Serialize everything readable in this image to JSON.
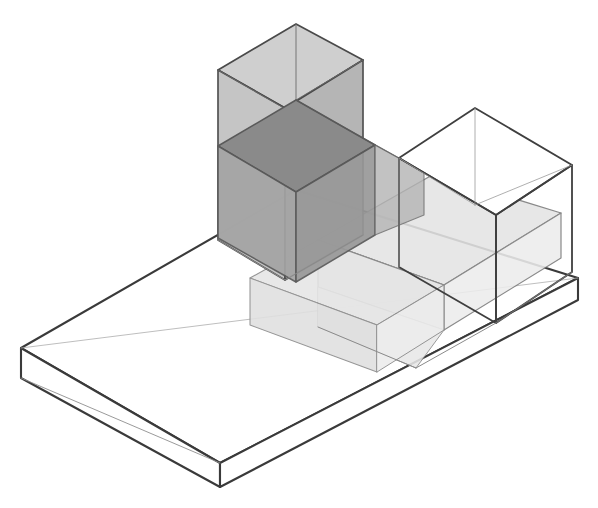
{
  "figure": {
    "background_color": "#ffffff",
    "canvas": {
      "width": 598,
      "height": 508
    }
  },
  "projection": {
    "type": "isometric",
    "origin_x": 21,
    "origin_y": 348,
    "unit_right_x": 89.3,
    "unit_right_y": -29.3,
    "unit_back_x": 68.8,
    "unit_back_y": -39.5,
    "unit_up_y": -79.0,
    "slab_thickness_px": 30
  },
  "palette": {
    "paper": "#ffffff",
    "line_dark": "#3a3a3a",
    "line_mid": "#6e6e6e",
    "line_light": "#9a9a9a",
    "fill_none": "#ffffff",
    "fill_light": "#e2e2e2",
    "fill_medium": "#c9c9c9",
    "fill_mediumdark": "#a9a9a9",
    "fill_dark": "#8c8c8c",
    "fill_darkest": "#6f6f6f"
  },
  "volumes": [
    {
      "id": "base-slab",
      "name": "base-slab",
      "label": "Base slab",
      "fill": "#ffffff",
      "stroke": "#3a3a3a",
      "opacity": 1.0,
      "height_units": 0.38,
      "footprint": {
        "x": 0,
        "y": 0,
        "w": 4,
        "d": 2
      }
    },
    {
      "id": "tall-tower",
      "name": "tall-tower-volume",
      "label": "Tall tower volume",
      "fill": "#bcbcbc",
      "stroke": "#4a4a4a",
      "opacity": 0.78,
      "height_units": 2.15,
      "footprint": {
        "x": 1,
        "y": 0.5,
        "w": 1,
        "d": 1
      }
    },
    {
      "id": "mid-cube",
      "name": "mid-cube-volume",
      "label": "Middle cube volume",
      "fill": "#9a9a9a",
      "stroke": "#4a4a4a",
      "opacity": 0.7,
      "height_units": 1.1,
      "footprint": {
        "x": 1.55,
        "y": 0.5,
        "w": 1,
        "d": 1
      }
    },
    {
      "id": "low-slab",
      "name": "low-slab-volume",
      "label": "Low slab volume",
      "fill": "#dcdcdc",
      "stroke": "#6e6e6e",
      "opacity": 0.75,
      "height_units": 0.55,
      "footprint": {
        "x": 1.55,
        "y": 0,
        "w": 1.6,
        "d": 1.55
      }
    },
    {
      "id": "wire-cube",
      "name": "wireframe-cube-volume",
      "label": "Wireframe cube volume",
      "fill": "#ffffff",
      "stroke": "#4a4a4a",
      "opacity": 0.0,
      "height_units": 1.1,
      "footprint": {
        "x": 2.9,
        "y": 0.55,
        "w": 1.05,
        "d": 1.0
      }
    }
  ],
  "legend_visible": false,
  "annotations": []
}
